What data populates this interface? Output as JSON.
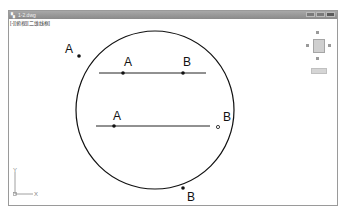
{
  "window": {
    "title": "1-2.dwg",
    "viewport_label": "[-][俯视][二维线框]",
    "buttons": [
      "minimize",
      "maximize",
      "close"
    ]
  },
  "viewcube": {
    "face_label": "上",
    "compass": [
      "北",
      "东",
      "南",
      "西"
    ],
    "wcs_label": "WCS"
  },
  "drawing": {
    "circle": {
      "cx": 155,
      "cy": 110,
      "r": 80
    },
    "labels": [
      {
        "text": "A",
        "x": 66,
        "y": 53
      },
      {
        "text": "A",
        "x": 125,
        "y": 66
      },
      {
        "text": "B",
        "x": 183,
        "y": 66
      },
      {
        "text": "A",
        "x": 114,
        "y": 122
      },
      {
        "text": "B",
        "x": 222,
        "y": 122
      },
      {
        "text": "B",
        "x": 188,
        "y": 201
      }
    ],
    "lines": [
      {
        "x1": 99,
        "y1": 73,
        "x2": 206,
        "y2": 73
      },
      {
        "x1": 96,
        "y1": 126,
        "x2": 210,
        "y2": 126
      }
    ],
    "points": [
      {
        "x": 79,
        "y": 56,
        "type": "filled"
      },
      {
        "x": 123,
        "y": 73,
        "type": "filled"
      },
      {
        "x": 183,
        "y": 73,
        "type": "filled"
      },
      {
        "x": 114,
        "y": 126,
        "type": "filled"
      },
      {
        "x": 218,
        "y": 127,
        "type": "hollow"
      },
      {
        "x": 183,
        "y": 188,
        "type": "filled"
      }
    ],
    "ucs": {
      "x_label": "X",
      "y_label": "Y"
    }
  }
}
